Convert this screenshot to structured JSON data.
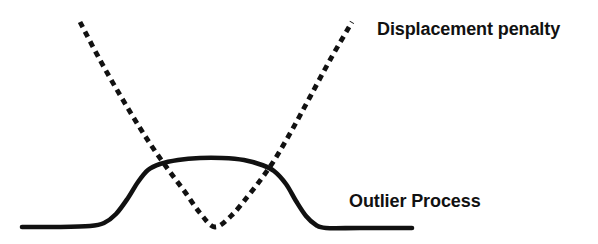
{
  "figure": {
    "background_color": "#ffffff",
    "ink_color": "#111111",
    "width": 598,
    "height": 244
  },
  "labels": {
    "displacement_penalty": "Displacement penalty",
    "outlier_process": "Outlier Process"
  },
  "chart_data": {
    "type": "line",
    "title": "",
    "subtitle": "",
    "xlabel": "",
    "ylabel": "",
    "grid": false,
    "axes_visible": false,
    "legend_position": "inline-annotation",
    "xlim": [
      0,
      598
    ],
    "ylim": [
      244,
      0
    ],
    "note": "Hand-drawn schematic comparing a quadratic displacement penalty with the corresponding saturating outlier process. Coordinates are in image pixel space (y increases downward).",
    "series": [
      {
        "name": "Displacement penalty",
        "style": "dashed",
        "color": "#111111",
        "stroke_width": 4.8,
        "dash_pattern": [
          6,
          5
        ],
        "shape": "quadratic",
        "vertex": [
          215,
          227
        ],
        "points": [
          [
            80,
            22
          ],
          [
            100,
            60
          ],
          [
            120,
            95
          ],
          [
            140,
            128
          ],
          [
            155,
            151
          ],
          [
            170,
            172
          ],
          [
            185,
            192
          ],
          [
            200,
            213
          ],
          [
            215,
            227
          ],
          [
            232,
            215
          ],
          [
            248,
            196
          ],
          [
            262,
            178
          ],
          [
            275,
            159
          ],
          [
            292,
            130
          ],
          [
            310,
            97
          ],
          [
            330,
            60
          ],
          [
            352,
            22
          ]
        ]
      },
      {
        "name": "Outlier Process",
        "style": "solid",
        "color": "#111111",
        "stroke_width": 4.6,
        "shape": "saturating-bump",
        "plateau_low_y": 227,
        "plateau_high_y": 158,
        "points": [
          [
            22,
            227
          ],
          [
            60,
            227
          ],
          [
            90,
            226
          ],
          [
            104,
            223
          ],
          [
            116,
            214
          ],
          [
            128,
            198
          ],
          [
            138,
            182
          ],
          [
            148,
            170
          ],
          [
            160,
            164
          ],
          [
            178,
            160
          ],
          [
            200,
            158
          ],
          [
            222,
            158
          ],
          [
            244,
            160
          ],
          [
            262,
            165
          ],
          [
            274,
            171
          ],
          [
            286,
            184
          ],
          [
            296,
            201
          ],
          [
            306,
            216
          ],
          [
            316,
            225
          ],
          [
            326,
            228
          ],
          [
            360,
            228
          ],
          [
            412,
            228
          ]
        ]
      }
    ],
    "annotations": [
      {
        "text": "Displacement penalty",
        "x": 377,
        "y": 33,
        "anchor": "start",
        "bold": true,
        "refers_to": "Displacement penalty"
      },
      {
        "text": "Outlier Process",
        "x": 349,
        "y": 205,
        "anchor": "start",
        "bold": true,
        "refers_to": "Outlier Process"
      }
    ],
    "intersections": [
      [
        155,
        166
      ],
      [
        275,
        170
      ]
    ]
  }
}
